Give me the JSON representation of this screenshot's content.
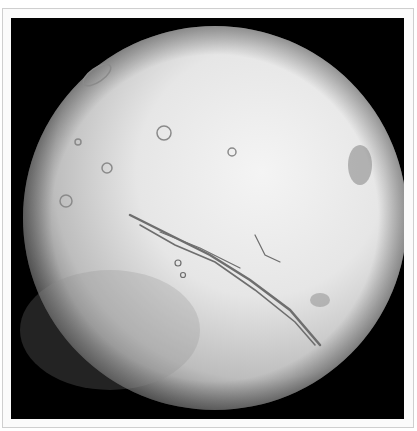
{
  "image": {
    "subject": "Mars globe (grayscale) showing Valles Marineris and Tharsis volcanoes",
    "background_color": "#000000",
    "border_color": "#fbfbfb",
    "planet": {
      "center_x": 215,
      "center_y": 218,
      "radius": 192,
      "highlight_color": "#f2f2f2",
      "shadow_color": "#2a2a2a"
    }
  }
}
